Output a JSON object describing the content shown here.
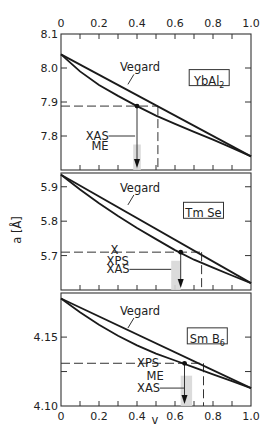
{
  "chart_data": {
    "type": "line",
    "shared_x": {
      "label": "v",
      "range": [
        0,
        1.0
      ],
      "ticks": [
        0,
        0.2,
        0.4,
        0.6,
        0.8,
        1.0
      ],
      "tick_labels": [
        "0",
        "0.2",
        "0.4",
        "0.6",
        "0.8",
        "1.0"
      ]
    },
    "ylabel": "a [Å]",
    "panels": [
      {
        "compound": "YbAl2",
        "compound_display": [
          "YbAl",
          "2"
        ],
        "ylim": [
          7.7,
          8.1
        ],
        "yticks": [
          8.0,
          7.9,
          7.8
        ],
        "ytick_labels": [
          "8.1",
          "8.0",
          "7.9",
          "7.8"
        ],
        "ytick_label_values": [
          8.1,
          8.0,
          7.9,
          7.8
        ],
        "minor_y_step": 0.1,
        "series": [
          {
            "name": "Vegard",
            "x": [
              0,
              1.0
            ],
            "y": [
              8.04,
              7.74
            ],
            "shape": "linear"
          },
          {
            "name": "measured",
            "x": [
              0,
              0.1,
              0.2,
              0.3,
              0.4,
              0.5,
              0.6,
              0.7,
              0.8,
              0.9,
              1.0
            ],
            "y": [
              8.04,
              7.99,
              7.95,
              7.918,
              7.888,
              7.86,
              7.836,
              7.812,
              7.789,
              7.765,
              7.74
            ]
          }
        ],
        "marker": {
          "v": 0.4,
          "a": 7.888
        },
        "vegard_v": 0.51,
        "band": {
          "v0": 0.38,
          "v1": 0.42,
          "from": 7.775,
          "to": 7.7
        },
        "labels": [
          {
            "text": "XAS",
            "v": 0.13,
            "a": 7.8,
            "leader_to_v": 0.39
          },
          {
            "text": "ME",
            "v": 0.16,
            "a": 7.77
          }
        ],
        "vegard_label_pos": {
          "v": 0.31,
          "a": 7.99
        },
        "box_pos": {
          "v": 0.78,
          "a": 7.96
        }
      },
      {
        "compound": "TmSe",
        "compound_display": [
          "Tm Se",
          ""
        ],
        "ylim": [
          5.6,
          5.94
        ],
        "ytick_label_values": [
          5.9,
          5.8,
          5.7
        ],
        "ytick_labels": [
          "5.9",
          "5.8",
          "5.7"
        ],
        "series": [
          {
            "name": "Vegard",
            "x": [
              0,
              1.0
            ],
            "y": [
              5.935,
              5.62
            ],
            "shape": "linear"
          },
          {
            "name": "measured",
            "x": [
              0,
              0.1,
              0.2,
              0.3,
              0.4,
              0.5,
              0.6,
              0.7,
              0.8,
              0.9,
              1.0
            ],
            "y": [
              5.935,
              5.892,
              5.852,
              5.815,
              5.78,
              5.748,
              5.716,
              5.688,
              5.665,
              5.642,
              5.62
            ]
          }
        ],
        "marker": {
          "v": 0.63,
          "a": 5.71
        },
        "vegard_v": 0.74,
        "band": {
          "v0": 0.58,
          "v1": 0.63,
          "from": 5.685,
          "to": 5.6
        },
        "labels": [
          {
            "text": "X",
            "v": 0.26,
            "a": 5.715,
            "leader_to_v": 0.28,
            "leader_a": 5.71
          },
          {
            "text": "XPS",
            "v": 0.24,
            "a": 5.685
          },
          {
            "text": "XAS",
            "v": 0.24,
            "a": 5.66,
            "leader_to_v": 0.58
          }
        ],
        "vegard_label_pos": {
          "v": 0.31,
          "a": 5.885
        },
        "box_pos": {
          "v": 0.75,
          "a": 5.82
        }
      },
      {
        "compound": "SmB6",
        "compound_display": [
          "Sm B",
          "6"
        ],
        "ylim": [
          4.1,
          4.182
        ],
        "ytick_label_values": [
          4.15,
          4.1
        ],
        "ytick_labels": [
          "4.15",
          "4.10"
        ],
        "minor_y_ticks": [
          4.125
        ],
        "series": [
          {
            "name": "Vegard",
            "x": [
              0,
              1.0
            ],
            "y": [
              4.178,
              4.113
            ],
            "shape": "linear"
          },
          {
            "name": "measured",
            "x": [
              0,
              0.1,
              0.2,
              0.3,
              0.4,
              0.5,
              0.6,
              0.7,
              0.8,
              0.9,
              1.0
            ],
            "y": [
              4.178,
              4.168,
              4.159,
              4.151,
              4.144,
              4.138,
              4.133,
              4.128,
              4.123,
              4.118,
              4.113
            ]
          }
        ],
        "marker": {
          "v": 0.65,
          "a": 4.131
        },
        "vegard_v": 0.75,
        "band": {
          "v0": 0.63,
          "v1": 0.69,
          "from": 4.122,
          "to": 4.1
        },
        "labels": [
          {
            "text": "XPS",
            "v": 0.4,
            "a": 4.131
          },
          {
            "text": "ME",
            "v": 0.45,
            "a": 4.122
          },
          {
            "text": "XAS",
            "v": 0.4,
            "a": 4.113,
            "leader_to_v": 0.65
          }
        ],
        "vegard_label_pos": {
          "v": 0.31,
          "a": 4.166
        },
        "box_pos": {
          "v": 0.77,
          "a": 4.148
        }
      }
    ]
  }
}
